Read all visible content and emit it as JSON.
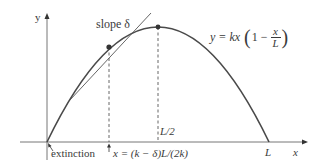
{
  "diagram": {
    "axis_y_label": "y",
    "axis_x_label": "x",
    "slope_label": "slope δ",
    "equation": {
      "lhs": "y = kx",
      "paren_one": "1 −",
      "frac_num": "x",
      "frac_den": "L"
    },
    "half_label": "L/2",
    "end_label": "L",
    "extinction_label": "extinction",
    "tangent_x_label": "x = (k − δ)L/(2k)",
    "colors": {
      "curve": "#4a4a4a",
      "axis": "#555555",
      "text": "#3a3a3a"
    }
  }
}
